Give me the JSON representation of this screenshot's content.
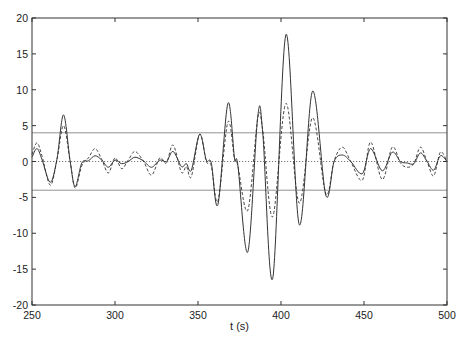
{
  "chart_data": {
    "type": "line",
    "title": "",
    "xlabel": "t (s)",
    "ylabel": "",
    "xlim": [
      250,
      500
    ],
    "ylim": [
      -20,
      20
    ],
    "xticks": [
      250,
      300,
      350,
      400,
      450,
      500
    ],
    "yticks": [
      -20,
      -15,
      -10,
      -5,
      0,
      5,
      10,
      15,
      20
    ],
    "grid": false,
    "legend": null,
    "reference_lines": [
      {
        "name": "upper-threshold",
        "y": 4,
        "style": "solid-thin"
      },
      {
        "name": "zero-line",
        "y": 0,
        "style": "dotted"
      },
      {
        "name": "lower-threshold",
        "y": -4,
        "style": "solid-thin"
      }
    ],
    "series": [
      {
        "name": "solid",
        "style": "solid",
        "color": "#333333",
        "points": [
          [
            250,
            0.6
          ],
          [
            253,
            1.8
          ],
          [
            256,
            0.3
          ],
          [
            261,
            -2.9
          ],
          [
            265,
            0.3
          ],
          [
            269,
            6.5
          ],
          [
            273,
            0.0
          ],
          [
            276,
            -3.5
          ],
          [
            280,
            -0.2
          ],
          [
            284,
            0.1
          ],
          [
            288,
            0.8
          ],
          [
            292,
            0.2
          ],
          [
            296,
            -0.8
          ],
          [
            300,
            0.2
          ],
          [
            304,
            -0.3
          ],
          [
            308,
            0.0
          ],
          [
            312,
            0.6
          ],
          [
            317,
            0.1
          ],
          [
            322,
            -0.8
          ],
          [
            327,
            0.2
          ],
          [
            331,
            0.0
          ],
          [
            335,
            1.4
          ],
          [
            340,
            -0.7
          ],
          [
            343,
            -0.3
          ],
          [
            346,
            -1.2
          ],
          [
            351,
            3.8
          ],
          [
            355,
            0.2
          ],
          [
            358,
            -0.2
          ],
          [
            362,
            -6.0
          ],
          [
            368,
            8.1
          ],
          [
            372,
            0.5
          ],
          [
            374,
            -0.5
          ],
          [
            380,
            -12.6
          ],
          [
            386,
            6.3
          ],
          [
            389,
            4.0
          ],
          [
            395,
            -16.3
          ],
          [
            403,
            17.7
          ],
          [
            411,
            -8.8
          ],
          [
            419,
            9.8
          ],
          [
            427,
            -4.7
          ],
          [
            432,
            0.0
          ],
          [
            437,
            0.9
          ],
          [
            442,
            0.0
          ],
          [
            449,
            -1.7
          ],
          [
            454,
            1.8
          ],
          [
            461,
            -1.3
          ],
          [
            467,
            1.3
          ],
          [
            472,
            0.0
          ],
          [
            476,
            -0.2
          ],
          [
            480,
            -0.3
          ],
          [
            484,
            1.2
          ],
          [
            488,
            0.0
          ],
          [
            492,
            -1.2
          ],
          [
            496,
            0.8
          ],
          [
            500,
            0.0
          ]
        ]
      },
      {
        "name": "dashed",
        "style": "dashed",
        "color": "#333333",
        "points": [
          [
            250,
            1.0
          ],
          [
            253,
            2.6
          ],
          [
            256,
            0.8
          ],
          [
            261,
            -3.3
          ],
          [
            265,
            0.2
          ],
          [
            269,
            5.0
          ],
          [
            273,
            0.0
          ],
          [
            276,
            -3.7
          ],
          [
            280,
            -0.6
          ],
          [
            284,
            0.5
          ],
          [
            288,
            1.8
          ],
          [
            292,
            0.3
          ],
          [
            296,
            -1.6
          ],
          [
            300,
            0.5
          ],
          [
            304,
            -1.0
          ],
          [
            308,
            0.2
          ],
          [
            312,
            1.4
          ],
          [
            317,
            0.1
          ],
          [
            322,
            -1.9
          ],
          [
            327,
            0.5
          ],
          [
            331,
            -0.2
          ],
          [
            335,
            2.3
          ],
          [
            340,
            -1.5
          ],
          [
            343,
            -0.7
          ],
          [
            346,
            -2.1
          ],
          [
            351,
            3.8
          ],
          [
            355,
            0.0
          ],
          [
            358,
            -0.6
          ],
          [
            362,
            -5.5
          ],
          [
            368,
            5.5
          ],
          [
            372,
            0.3
          ],
          [
            374,
            -0.6
          ],
          [
            380,
            -6.8
          ],
          [
            386,
            6.0
          ],
          [
            389,
            4.3
          ],
          [
            395,
            -7.7
          ],
          [
            403,
            8.1
          ],
          [
            411,
            -5.8
          ],
          [
            419,
            6.1
          ],
          [
            427,
            -4.5
          ],
          [
            432,
            0.1
          ],
          [
            437,
            2.0
          ],
          [
            442,
            0.0
          ],
          [
            449,
            -2.6
          ],
          [
            454,
            2.7
          ],
          [
            461,
            -2.5
          ],
          [
            467,
            2.0
          ],
          [
            472,
            -0.2
          ],
          [
            476,
            -0.8
          ],
          [
            480,
            -0.3
          ],
          [
            484,
            2.0
          ],
          [
            488,
            0.0
          ],
          [
            492,
            -2.0
          ],
          [
            496,
            1.3
          ],
          [
            500,
            0.0
          ]
        ]
      }
    ]
  }
}
